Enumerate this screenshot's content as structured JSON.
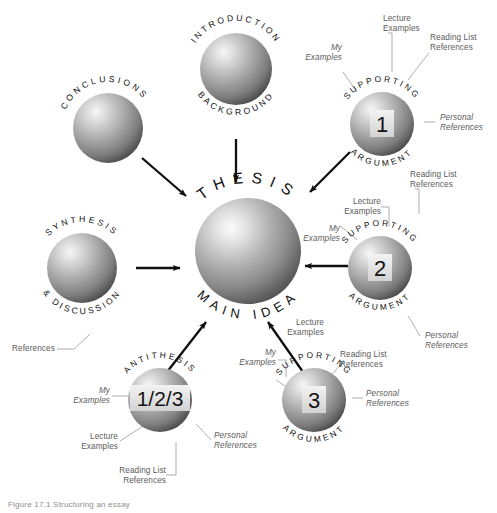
{
  "figure": {
    "caption": "Figure 17.1 Structuring an essay",
    "background_color": "#ffffff",
    "ink_color": "#5b5b5b",
    "arrow_color": "#111111",
    "sphere_light": "#f2f2f2",
    "sphere_mid": "#a8a8a8",
    "sphere_dark": "#4c4c4c",
    "badge_bg": "#e8e8e8",
    "badge_text": "#1a1a1a"
  },
  "nodes": {
    "center": {
      "id": "thesis",
      "arc_top": "THESIS",
      "arc_bottom": "MAIN IDEA",
      "badge": ""
    },
    "introduction": {
      "id": "introduction-background",
      "arc_top": "INTRODUCTION",
      "arc_bottom": "BACKGROUND",
      "badge": ""
    },
    "conclusions": {
      "id": "conclusions",
      "arc_top": "CONCLUSIONS",
      "arc_bottom": "",
      "badge": ""
    },
    "synthesis": {
      "id": "synthesis-discussion",
      "arc_top": "SYNTHESIS",
      "arc_bottom": "& DISCUSSION",
      "badge": ""
    },
    "argument1": {
      "id": "supporting-argument-1",
      "arc_top": "SUPPORTING",
      "arc_bottom": "ARGUMENT",
      "badge": "1"
    },
    "argument2": {
      "id": "supporting-argument-2",
      "arc_top": "SUPPORTING",
      "arc_bottom": "ARGUMENT",
      "badge": "2"
    },
    "argument3": {
      "id": "supporting-argument-3",
      "arc_top": "SUPPORTING",
      "arc_bottom": "ARGUMENT",
      "badge": "3"
    },
    "antithesis": {
      "id": "antithesis",
      "arc_top": "ANTITHESIS",
      "arc_bottom": "",
      "badge": "1/2/3"
    }
  },
  "labels": {
    "lecture_examples": "Lecture\nExamples",
    "my_examples": "My\nExamples",
    "reading_list_references": "Reading List\nReferences",
    "personal_references": "Personal\nReferences",
    "references": "References"
  },
  "annotations": {
    "arg1": {
      "my_examples": "My\nExamples",
      "lecture_examples": "Lecture\nExamples",
      "reading_list": "Reading List\nReferences",
      "personal": "Personal\nReferences"
    },
    "arg2": {
      "my_examples": "My\nExamples",
      "lecture_examples": "Lecture\nExamples",
      "reading_list": "Reading List\nReferences",
      "personal": "Personal\nReferences"
    },
    "arg3": {
      "my_examples": "My\nExamples",
      "lecture_examples": "Lecture\nExamples",
      "reading_list": "Reading List\nReferences",
      "personal": "Personal\nReferences"
    },
    "antithesis": {
      "my_examples": "My\nExamples",
      "lecture_examples": "Lecture\nExamples",
      "reading_list": "Reading List\nReferences",
      "personal": "Personal\nReferences"
    },
    "synthesis": {
      "references": "References"
    }
  },
  "arrows": [
    {
      "from": "conclusions",
      "to": "thesis"
    },
    {
      "from": "introduction",
      "to": "thesis"
    },
    {
      "from": "supporting-argument-1",
      "to": "thesis"
    },
    {
      "from": "supporting-argument-2",
      "to": "thesis"
    },
    {
      "from": "synthesis-discussion",
      "to": "thesis"
    },
    {
      "from": "antithesis",
      "to": "thesis"
    },
    {
      "from": "supporting-argument-3",
      "to": "thesis"
    }
  ]
}
